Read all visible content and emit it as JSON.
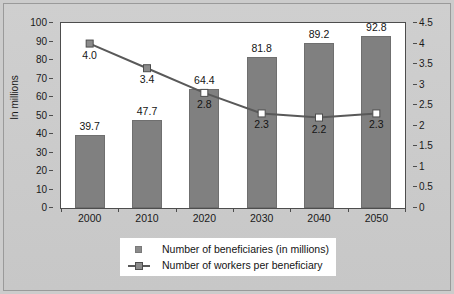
{
  "chart_data": {
    "type": "bar",
    "title": "",
    "subtitle": "",
    "categories": [
      "2000",
      "2010",
      "2020",
      "2030",
      "2040",
      "2050"
    ],
    "xlabel": "",
    "ylabel": "In millions",
    "y2label": "",
    "ylim": [
      0,
      100
    ],
    "y2lim": [
      0,
      4.5
    ],
    "yticks": [
      "0",
      "10",
      "20",
      "30",
      "40",
      "50",
      "60",
      "70",
      "80",
      "90",
      "100"
    ],
    "y2ticks": [
      "0",
      "0.5",
      "1",
      "1.5",
      "2",
      "2.5",
      "3",
      "3.5",
      "4",
      "4.5"
    ],
    "grid": false,
    "legend_position": "bottom",
    "series": [
      {
        "name": "Number of beneficiaries (in millions)",
        "type": "bar",
        "axis": "left",
        "color": "#808080",
        "values": [
          39.7,
          47.7,
          64.4,
          81.8,
          89.2,
          92.8
        ],
        "labels": [
          "39.7",
          "47.7",
          "64.4",
          "81.8",
          "89.2",
          "92.8"
        ]
      },
      {
        "name": "Number of workers per beneficiary",
        "type": "line",
        "axis": "right",
        "color": "#595959",
        "values": [
          4.0,
          3.4,
          2.8,
          2.3,
          2.2,
          2.3
        ],
        "labels": [
          "4.0",
          "3.4",
          "2.8",
          "2.3",
          "2.2",
          "2.3"
        ],
        "marker": "square"
      }
    ]
  },
  "legend": {
    "items": [
      {
        "label": "Number of beneficiaries (in millions)",
        "marker": "filled-square"
      },
      {
        "label": "Number of workers per beneficiary",
        "marker": "line-square"
      }
    ]
  }
}
